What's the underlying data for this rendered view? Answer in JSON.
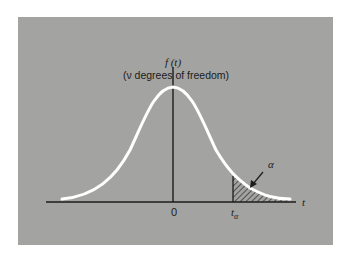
{
  "figure": {
    "ylabel": "f (t)",
    "subtitle": "(ν degrees of freedom)",
    "xlabel": "t",
    "origin_label": "0",
    "critical_label": "t",
    "critical_subscript": "α",
    "tail_label": "α",
    "colors": {
      "background": "#a3a3a1",
      "curve": "#ffffff",
      "axis": "#1c1c1c",
      "hatch": "#1c1c1c"
    }
  }
}
